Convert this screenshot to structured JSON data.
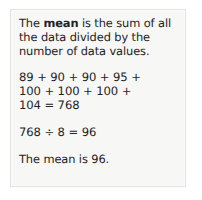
{
  "card": {
    "definition": {
      "prefix": "The ",
      "term": "mean",
      "suffix": " is the sum of all\nthe data divided by the\nnumber of data values."
    },
    "sum": "89 + 90 + 90 + 95 +\n100 + 100 + 100 +\n104 = 768",
    "quotient": "768 ÷ 8 = 96",
    "conclusion": "The mean is 96."
  },
  "values": {
    "data_values": [
      89,
      90,
      90,
      95,
      100,
      100,
      100,
      104
    ],
    "count": 8,
    "sum": 768,
    "mean": 96
  },
  "colors": {
    "page_background": "#ffffff",
    "card_background": "#f7f7f6",
    "card_border": "#e2e2e0",
    "text": "#232323"
  }
}
